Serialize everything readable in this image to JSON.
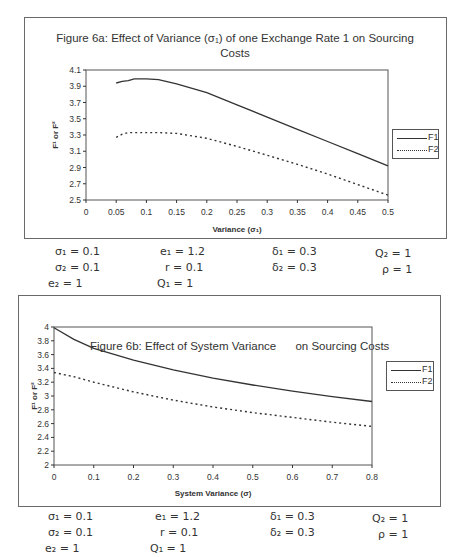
{
  "chart_data": [
    {
      "type": "line",
      "title": "Figure 6a: Effect of Variance (σ1) of one Exchange Rate 1 on Sourcing Costs",
      "title_line1": "Figure 6a: Effect of Variance (σ₁) of one Exchange Rate 1 on Sourcing",
      "title_line2": "Costs",
      "xlabel": "Variance (σ₁)",
      "ylabel": "F¹ or F²",
      "xlim": [
        0,
        0.5
      ],
      "ylim": [
        2.5,
        4.1
      ],
      "x_ticks": [
        "0",
        "0.05",
        "0.1",
        "0.15",
        "0.2",
        "0.25",
        "0.3",
        "0.35",
        "0.4",
        "0.45",
        "0.5"
      ],
      "y_ticks": [
        "4.1",
        "3.9",
        "3.7",
        "3.5",
        "3.3",
        "3.1",
        "2.9",
        "2.7",
        "2.5"
      ],
      "grid": false,
      "legend_position": "right",
      "x": [
        0.05,
        0.06,
        0.07,
        0.08,
        0.09,
        0.1,
        0.12,
        0.15,
        0.2,
        0.25,
        0.3,
        0.35,
        0.4,
        0.45,
        0.5
      ],
      "series": [
        {
          "name": "F1",
          "style": "solid",
          "values": [
            3.94,
            3.96,
            3.97,
            3.99,
            3.99,
            3.99,
            3.98,
            3.93,
            3.82,
            3.67,
            3.52,
            3.37,
            3.22,
            3.07,
            2.92
          ]
        },
        {
          "name": "F2",
          "style": "dotted",
          "values": [
            3.27,
            3.31,
            3.33,
            3.33,
            3.33,
            3.33,
            3.33,
            3.32,
            3.26,
            3.16,
            3.05,
            2.94,
            2.82,
            2.69,
            2.56
          ]
        }
      ]
    },
    {
      "type": "line",
      "title": "Figure 6b: Effect of System Variance on Sourcing Costs",
      "title_line1": "Figure 6b: Effect of System Variance      on Sourcing Costs",
      "xlabel": "System Variance (σ)",
      "ylabel": "F¹ or F²",
      "xlim": [
        0,
        0.8
      ],
      "ylim": [
        2,
        4
      ],
      "x_ticks": [
        "0",
        "0.1",
        "0.2",
        "0.3",
        "0.4",
        "0.5",
        "0.6",
        "0.7",
        "0.8"
      ],
      "y_ticks": [
        "4",
        "3.8",
        "3.6",
        "3.4",
        "3.2",
        "3",
        "2.8",
        "2.6",
        "2.4",
        "2.2",
        "2"
      ],
      "grid": false,
      "legend_position": "right",
      "x": [
        0,
        0.05,
        0.1,
        0.2,
        0.3,
        0.4,
        0.5,
        0.6,
        0.7,
        0.8
      ],
      "series": [
        {
          "name": "F1",
          "style": "solid",
          "values": [
            3.99,
            3.82,
            3.69,
            3.52,
            3.38,
            3.26,
            3.16,
            3.07,
            2.99,
            2.92
          ]
        },
        {
          "name": "F2",
          "style": "dotted",
          "values": [
            3.34,
            3.28,
            3.2,
            3.06,
            2.94,
            2.84,
            2.76,
            2.69,
            2.62,
            2.56
          ]
        }
      ]
    }
  ],
  "legend": {
    "f1": "F1",
    "f2": "F2"
  },
  "params_a": {
    "sigma1": "σ₁ = 0.1",
    "e1": "e₁  =  1.2",
    "delta1": "δ₁ = 0.3",
    "q2": "Q₂  =  1",
    "sigma2": "σ₂ = 0.1",
    "r": "r  =  0.1",
    "delta2": "δ₂ = 0.3",
    "rho": "ρ  =  1",
    "e2": "e₂  =  1",
    "q1": "Q₁  =  1"
  },
  "params_b": {
    "sigma1": "σ₁ = 0.1",
    "e1": "e₁  =  1.2",
    "delta1": "δ₁ = 0.3",
    "q2": "Q₂  =  1",
    "sigma2": "σ₂ = 0.1",
    "r": "r  =  0.1",
    "delta2": "δ₂ = 0.3",
    "rho": "ρ  =  1",
    "e2": "e₂  =  1",
    "q1": "Q₁  =  1"
  }
}
